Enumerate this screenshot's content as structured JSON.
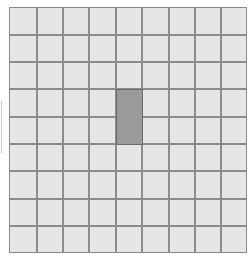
{
  "grid": {
    "columns": 9,
    "rows": 9,
    "cell_color": "#e6e6e6",
    "line_color": "#8c8c8c",
    "col_lines": [
      27,
      53,
      79,
      106,
      132,
      159,
      185,
      211
    ],
    "row_lines": [
      27,
      54,
      81,
      109,
      136,
      163,
      191,
      218
    ],
    "highlight": {
      "col": 4,
      "row_start": 3,
      "row_span": 2,
      "color": "#9a9a9a"
    }
  }
}
